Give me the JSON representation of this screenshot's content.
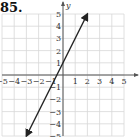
{
  "problem": {
    "number": "85."
  },
  "chart_data": {
    "type": "line",
    "title": "",
    "xlabel": "x",
    "ylabel": "y",
    "xlim": [
      -5,
      5
    ],
    "ylim": [
      -5,
      5
    ],
    "grid": true,
    "x_ticks": [
      -5,
      -4,
      -3,
      -2,
      -1,
      1,
      2,
      3,
      4,
      5
    ],
    "y_ticks": [
      -5,
      -4,
      -3,
      -2,
      -1,
      1,
      2,
      3,
      4,
      5
    ],
    "series": [
      {
        "name": "y = 2x + 1",
        "equation": "y = 2x + 1",
        "points": [
          [
            -3,
            -5
          ],
          [
            2,
            5
          ]
        ],
        "arrows": "both",
        "color": "#222222"
      }
    ]
  },
  "colors": {
    "grid": "#d8d8d8",
    "axis": "#555555",
    "line": "#222222"
  }
}
